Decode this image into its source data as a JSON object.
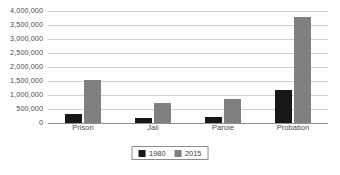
{
  "chart_data": {
    "type": "bar",
    "title": "",
    "subtitle": "",
    "xlabel": "",
    "ylabel": "",
    "categories": [
      "Prison",
      "Jail",
      "Parole",
      "Probation"
    ],
    "series": [
      {
        "name": "1980",
        "color": "#171717",
        "values": [
          320000,
          180000,
          220000,
          1180000
        ]
      },
      {
        "name": "2015",
        "color": "#808080",
        "values": [
          1530000,
          730000,
          870000,
          3790000
        ]
      }
    ],
    "ylim": [
      0,
      4000000
    ],
    "ytick_values": [
      0,
      500000,
      1000000,
      1500000,
      2000000,
      2500000,
      3000000,
      3500000,
      4000000
    ],
    "ytick_labels": [
      "0",
      "500,000",
      "1,000,000",
      "1,500,000",
      "2,000,000",
      "2,500,000",
      "3,000,000",
      "3,500,000",
      "4,000,000"
    ],
    "grid": true,
    "grid_axis": "y",
    "grid_color": "#cfcfcf",
    "legend": true,
    "legend_position": "bottom-center",
    "legend_entries": [
      "1980",
      "2015"
    ],
    "axis_color": "#8d8d8d",
    "background": "#ffffff"
  }
}
